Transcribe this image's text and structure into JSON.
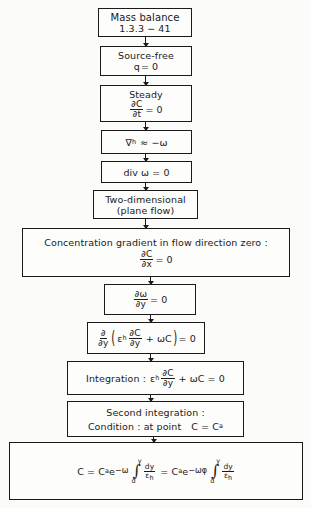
{
  "diagram": {
    "type": "flowchart",
    "direction": "top-to-bottom",
    "colors": {
      "stroke": "#1a1a1a",
      "background": "#fbfbf9"
    },
    "steps": [
      {
        "id": "mass-balance",
        "title": "Mass balance",
        "detail": "1.3.3 − 41"
      },
      {
        "id": "source-free",
        "title": "Source-free",
        "equation": {
          "lhs": "q",
          "rhs": "= 0"
        }
      },
      {
        "id": "steady",
        "title": "Steady",
        "equation": {
          "num": "∂C",
          "den": "∂t",
          "rhs": "= 0"
        }
      },
      {
        "id": "vh-omega",
        "equation": {
          "symbol": "∇",
          "sub": "h",
          "rhs": "≈ −ω"
        }
      },
      {
        "id": "div-omega",
        "equation": {
          "text": "div ω = 0"
        }
      },
      {
        "id": "two-dimensional",
        "title": "Two-dimensional",
        "detail": "(plane flow)"
      },
      {
        "id": "concentration-gradient",
        "title": "Concentration gradient in flow direction zero :",
        "equation": {
          "num": "∂C",
          "den": "∂x",
          "rhs": "= 0"
        }
      },
      {
        "id": "domega-dy",
        "equation": {
          "num": "∂ω",
          "den": "∂y",
          "rhs": "= 0"
        }
      },
      {
        "id": "d-dy-expression",
        "equation": {
          "outer_num": "∂",
          "outer_den": "∂y",
          "coef": "ε",
          "coef_sub": "h",
          "inner_num": "∂C",
          "inner_den": "∂y",
          "plus_term": "+ ωC",
          "rhs": "= 0"
        }
      },
      {
        "id": "integration",
        "label": "Integration :",
        "equation": {
          "coef": "ε",
          "coef_sub": "h",
          "num": "∂C",
          "den": "∂y",
          "plus_term": "+ ωC",
          "rhs": "= 0"
        }
      },
      {
        "id": "second-integration",
        "title": "Second integration :",
        "detail": "Condition : at point",
        "condition": "C = C",
        "condition_sub": "a"
      },
      {
        "id": "result",
        "equation": {
          "lhs": "C = C",
          "lhs_sub": "a",
          "e": "e",
          "exp1": "−ω",
          "lower": "d",
          "upper": "y",
          "frac_num": "dy",
          "frac_den": "ε",
          "frac_den_sub": "h",
          "mid": "= C",
          "mid_sub": "a",
          "exp2": "−ωφ",
          "integral_sign": "∫"
        }
      }
    ]
  }
}
